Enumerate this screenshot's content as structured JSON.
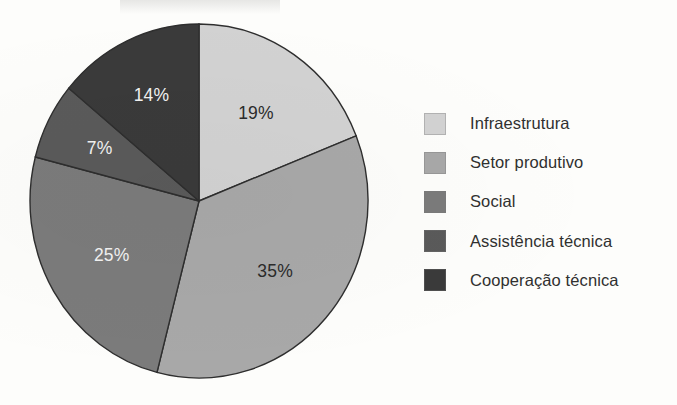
{
  "chart_data": {
    "type": "pie",
    "title": "",
    "subtitle": "",
    "xlabel": "",
    "ylabel": "",
    "grid": false,
    "legend_position": "right",
    "start_angle_deg": 0,
    "direction": "clockwise",
    "units": "percent",
    "categories": [
      "Infraestrutura",
      "Setor produtivo",
      "Social",
      "Assistência técnica",
      "Cooperação técnica"
    ],
    "values": [
      19,
      35,
      25,
      7,
      14
    ],
    "labels": [
      "19%",
      "35%",
      "25%",
      "7%",
      "14%"
    ],
    "colors": [
      "#d2d2d2",
      "#a8a8a8",
      "#7b7b7b",
      "#5a5a5a",
      "#3a3a3a"
    ],
    "label_text_colors": [
      "#2b2b2b",
      "#2b2b2b",
      "#f2f2f2",
      "#f2f2f2",
      "#f2f2f2"
    ],
    "slice_outline_color": "#2e2e2e",
    "background_color": "#fdfdfb"
  },
  "legend": {
    "items": [
      {
        "label": "Infraestrutura",
        "color": "#d2d2d2",
        "value": "19%"
      },
      {
        "label": "Setor produtivo",
        "color": "#a8a8a8",
        "value": "35%"
      },
      {
        "label": "Social",
        "color": "#7b7b7b",
        "value": "25%"
      },
      {
        "label": "Assistência técnica",
        "color": "#5a5a5a",
        "value": "7%"
      },
      {
        "label": "Cooperação técnica",
        "color": "#3a3a3a",
        "value": "14%"
      }
    ]
  },
  "pie_geometry": {
    "center_x": 199,
    "center_y": 201,
    "radius_x": 169,
    "radius_y": 177
  }
}
